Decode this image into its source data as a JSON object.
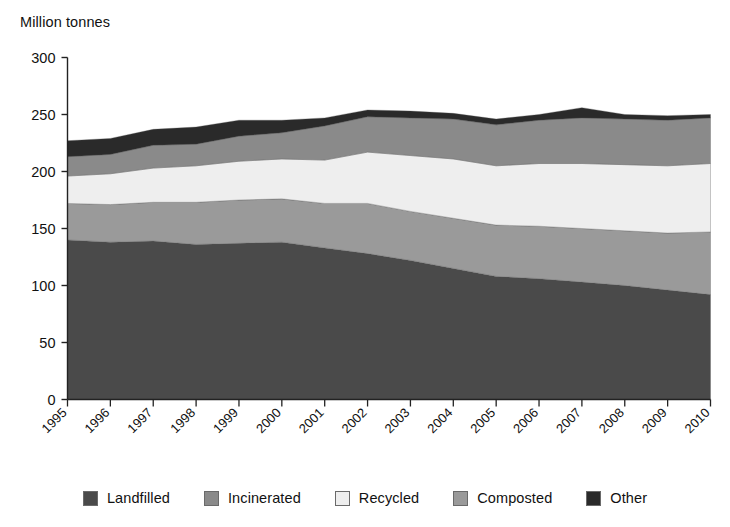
{
  "chart_data": {
    "type": "area",
    "stacked": true,
    "title": "Million tonnes",
    "xlabel": "",
    "ylabel": "Million tonnes",
    "ylim": [
      0,
      300
    ],
    "yticks": [
      0,
      50,
      100,
      150,
      200,
      250,
      300
    ],
    "grid": false,
    "legend_position": "bottom",
    "categories": [
      "1995",
      "1996",
      "1997",
      "1998",
      "1999",
      "2000",
      "2001",
      "2002",
      "2003",
      "2004",
      "2005",
      "2006",
      "2007",
      "2008",
      "2009",
      "2010"
    ],
    "series": [
      {
        "name": "Landfilled",
        "color": "#4a4a4a",
        "values": [
          140,
          138,
          139,
          136,
          137,
          138,
          133,
          128,
          122,
          115,
          108,
          106,
          103,
          100,
          96,
          92
        ]
      },
      {
        "name": "Composted",
        "color": "#9a9a9a",
        "values": [
          32,
          33,
          34,
          37,
          38,
          38,
          39,
          44,
          43,
          44,
          45,
          46,
          47,
          48,
          50,
          55
        ]
      },
      {
        "name": "Recycled",
        "color": "#eeeeee",
        "values": [
          24,
          27,
          30,
          32,
          34,
          35,
          38,
          45,
          49,
          52,
          52,
          55,
          57,
          58,
          59,
          60
        ]
      },
      {
        "name": "Incinerated",
        "color": "#8a8a8a",
        "values": [
          17,
          17,
          20,
          19,
          22,
          23,
          30,
          31,
          33,
          35,
          36,
          38,
          40,
          40,
          40,
          40
        ]
      },
      {
        "name": "Other",
        "color": "#2a2a2a",
        "values": [
          14,
          14,
          14,
          15,
          14,
          11,
          7,
          6,
          6,
          5,
          5,
          5,
          9,
          4,
          4,
          3
        ]
      }
    ],
    "totals": [
      227,
      229,
      237,
      239,
      245,
      245,
      247,
      254,
      253,
      251,
      246,
      250,
      256,
      250,
      249,
      250
    ]
  },
  "axis": {
    "title": "Million tonnes"
  },
  "legend": {
    "items": [
      {
        "label": "Landfilled",
        "color": "#4a4a4a"
      },
      {
        "label": "Incinerated",
        "color": "#8a8a8a"
      },
      {
        "label": "Recycled",
        "color": "#eeeeee"
      },
      {
        "label": "Composted",
        "color": "#9a9a9a"
      },
      {
        "label": "Other",
        "color": "#2a2a2a"
      }
    ]
  }
}
